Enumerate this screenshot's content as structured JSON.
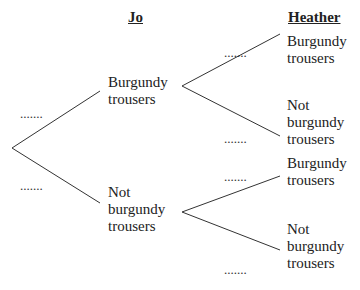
{
  "diagram": {
    "type": "probability-tree",
    "headers": {
      "first": "Jo",
      "second": "Heather"
    },
    "stage1": {
      "branches": [
        {
          "label_lines": [
            "Burgundy",
            "trousers"
          ],
          "probability": "......."
        },
        {
          "label_lines": [
            "Not",
            "burgundy",
            "trousers"
          ],
          "probability": "......."
        }
      ]
    },
    "stage2": {
      "from_burgundy": [
        {
          "label_lines": [
            "Burgundy",
            "trousers"
          ],
          "probability": "......."
        },
        {
          "label_lines": [
            "Not",
            "burgundy",
            "trousers"
          ],
          "probability": "......."
        }
      ],
      "from_not_burgundy": [
        {
          "label_lines": [
            "Burgundy",
            "trousers"
          ],
          "probability": "......."
        },
        {
          "label_lines": [
            "Not",
            "burgundy",
            "trousers"
          ],
          "probability": "......."
        }
      ]
    },
    "line_color": "#333333"
  }
}
